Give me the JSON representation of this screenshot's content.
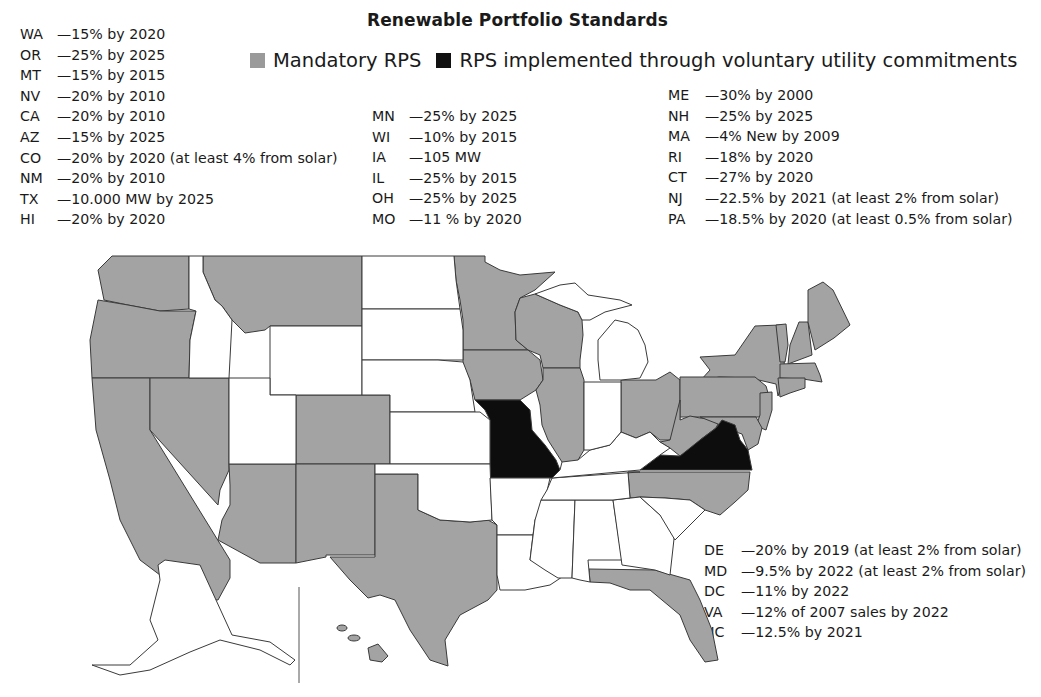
{
  "title": "Renewable Portfolio Standards",
  "legend": {
    "items": [
      {
        "label": "Mandatory RPS",
        "color": "#9e9e9e"
      },
      {
        "label": "RPS implemented through voluntary utility commitments",
        "color": "#111111"
      }
    ]
  },
  "colors": {
    "mandatory": "#a3a3a3",
    "voluntary": "#0d0d0d",
    "none": "#ffffff",
    "border": "#3a3a3a"
  },
  "targets": {
    "west": [
      {
        "state": "WA",
        "target": "—15% by 2020"
      },
      {
        "state": "OR",
        "target": "—25% by 2025"
      },
      {
        "state": "MT",
        "target": "—15% by 2015"
      },
      {
        "state": "NV",
        "target": "—20% by 2010"
      },
      {
        "state": "CA",
        "target": "—20% by 2010"
      },
      {
        "state": "AZ",
        "target": "—15% by 2025"
      },
      {
        "state": "CO",
        "target": "—20% by 2020 (at least 4% from solar)"
      },
      {
        "state": "NM",
        "target": "—20% by 2010"
      },
      {
        "state": "TX",
        "target": "—10.000 MW by 2025"
      },
      {
        "state": "HI",
        "target": "—20% by 2020"
      }
    ],
    "midwest": [
      {
        "state": "MN",
        "target": "—25% by 2025"
      },
      {
        "state": "WI",
        "target": "—10% by 2015"
      },
      {
        "state": "IA",
        "target": "—105 MW"
      },
      {
        "state": "IL",
        "target": "—25% by 2015"
      },
      {
        "state": "OH",
        "target": "—25% by 2025"
      },
      {
        "state": "MO",
        "target": "—11 % by 2020"
      }
    ],
    "northeast": [
      {
        "state": "ME",
        "target": "—30% by 2000"
      },
      {
        "state": "NH",
        "target": "—25% by 2025"
      },
      {
        "state": "MA",
        "target": "—4% New by 2009"
      },
      {
        "state": "RI",
        "target": "—18% by 2020"
      },
      {
        "state": "CT",
        "target": "—27% by 2020"
      },
      {
        "state": "NJ",
        "target": "—22.5% by 2021 (at least 2% from solar)"
      },
      {
        "state": "PA",
        "target": "—18.5% by 2020 (at least 0.5% from solar)"
      }
    ],
    "midatlantic": [
      {
        "state": "DE",
        "target": "—20% by 2019 (at least 2% from solar)"
      },
      {
        "state": "MD",
        "target": "—9.5% by 2022 (at least 2% from solar)"
      },
      {
        "state": "DC",
        "target": "—11% by 2022"
      },
      {
        "state": "VA",
        "target": "—12% of 2007 sales by 2022"
      },
      {
        "state": "NC",
        "target": "—12.5% by 2021"
      }
    ]
  },
  "map": {
    "mandatory_states": [
      "WA",
      "OR",
      "CA",
      "NV",
      "MT",
      "AZ",
      "CO",
      "NM",
      "TX",
      "MN",
      "WI",
      "IA",
      "IL",
      "OH",
      "NY",
      "PA",
      "NJ",
      "DE",
      "MD",
      "DC",
      "WV",
      "NC",
      "FL",
      "ME",
      "NH",
      "VT",
      "MA",
      "RI",
      "CT",
      "HI"
    ],
    "voluntary_states": [
      "MO",
      "VA"
    ],
    "no_rps_states": [
      "ID",
      "WY",
      "UT",
      "ND",
      "SD",
      "NE",
      "KS",
      "OK",
      "AR",
      "LA",
      "MS",
      "AL",
      "GA",
      "SC",
      "TN",
      "KY",
      "IN",
      "MI",
      "AK"
    ]
  }
}
